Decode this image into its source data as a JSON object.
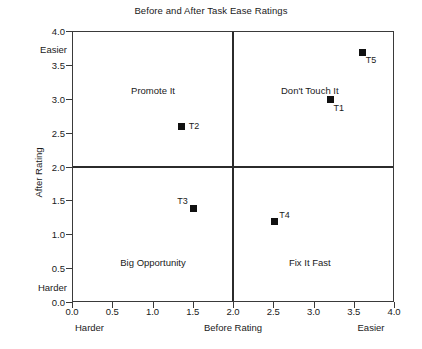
{
  "chart_data": {
    "type": "scatter",
    "title": "Before and After Task Ease Ratings",
    "xlabel": "Before Rating",
    "ylabel": "After Rating",
    "xlim": [
      0.0,
      4.0
    ],
    "ylim": [
      0.0,
      4.0
    ],
    "grid": false,
    "legend": "none",
    "x_ticks": [
      "0.0",
      "0.5",
      "1.0",
      "1.5",
      "2.0",
      "2.5",
      "3.0",
      "3.5",
      "4.0"
    ],
    "y_ticks": [
      "0.0",
      "0.5",
      "1.0",
      "1.5",
      "2.0",
      "2.5",
      "3.0",
      "3.5",
      "4.0"
    ],
    "x_anchor_low": "Harder",
    "x_anchor_high": "Easier",
    "y_anchor_low": "Harder",
    "y_anchor_high": "Easier",
    "reference_lines": {
      "x": 2.0,
      "y": 2.0
    },
    "points": [
      {
        "label": "T1",
        "x": 3.2,
        "y": 3.0,
        "label_position": "below-right"
      },
      {
        "label": "T2",
        "x": 1.35,
        "y": 2.6,
        "label_position": "right"
      },
      {
        "label": "T3",
        "x": 1.5,
        "y": 1.4,
        "label_position": "above-left"
      },
      {
        "label": "T4",
        "x": 2.5,
        "y": 1.2,
        "label_position": "above-right"
      },
      {
        "label": "T5",
        "x": 3.6,
        "y": 3.7,
        "label_position": "below-right"
      }
    ],
    "quadrants": [
      {
        "name": "top-left",
        "label": "Promote It"
      },
      {
        "name": "top-right",
        "label": "Don't Touch It"
      },
      {
        "name": "bottom-left",
        "label": "Big Opportunity"
      },
      {
        "name": "bottom-right",
        "label": "Fix It Fast"
      }
    ],
    "marker_color": "#111111",
    "axis_color": "#3a3a3a",
    "background_color": "#ffffff"
  }
}
